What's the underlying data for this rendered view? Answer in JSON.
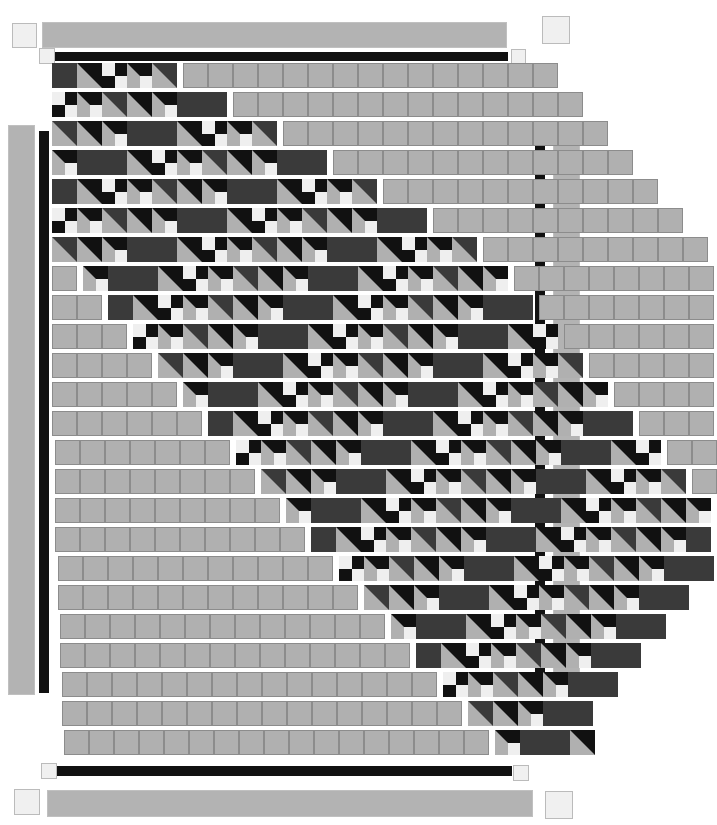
{
  "artwork": {
    "title": "Diagonal Staircase Quilt Pattern",
    "type": "abstract-geometric-pattern",
    "canvas": {
      "width": 590,
      "height": 825,
      "background": "#ffffff"
    }
  },
  "palette": {
    "light_gray": "#b0b0b0",
    "mid_gray": "#a8a8a8",
    "dark_gray": "#3a3a3a",
    "black": "#111111",
    "white": "#efefef",
    "border_light": "#c0c0c0",
    "corner": "#f0f0f0",
    "corner_stroke": "#bbbbbb",
    "cell_stroke": "#8c8c8c"
  },
  "geometry": {
    "cell_size": 25,
    "row_gap": 5,
    "rows": 24,
    "first_row_top": 63,
    "row_pitch": 29.2,
    "grid_left": 52,
    "grid_columns": 19
  },
  "borders": {
    "top_outer_bar": {
      "label": "top-light-bar",
      "x": 42,
      "y": 22,
      "w": 465,
      "h": 26,
      "color": "#b3b3b3"
    },
    "top_inner_bar": {
      "label": "top-black-bar",
      "x": 53,
      "y": 52,
      "w": 455,
      "h": 9,
      "color": "#111111"
    },
    "bottom_inner_bar": {
      "label": "bottom-black-bar",
      "x": 55,
      "y": 766,
      "w": 457,
      "h": 10,
      "color": "#111111"
    },
    "bottom_outer_bar": {
      "label": "bottom-light-bar",
      "x": 47,
      "y": 790,
      "w": 486,
      "h": 27,
      "color": "#b3b3b3"
    },
    "left_outer_bar": {
      "label": "left-light-bar",
      "x": 8,
      "y": 125,
      "w": 27,
      "h": 570,
      "color": "#b3b3b3"
    },
    "left_inner_bar": {
      "label": "left-black-bar",
      "x": 39,
      "y": 131,
      "w": 10,
      "h": 562,
      "color": "#111111"
    },
    "right_inner_bar": {
      "label": "right-black-bar",
      "x": 535,
      "y": 127,
      "w": 10,
      "h": 563,
      "color": "#111111"
    },
    "right_outer_bar": {
      "label": "right-light-bar",
      "x": 553,
      "y": 123,
      "w": 27,
      "h": 570,
      "color": "#b3b3b3"
    }
  },
  "corners": [
    {
      "name": "corner-top-left-outer",
      "x": 12,
      "y": 23,
      "size": 25
    },
    {
      "name": "corner-top-right-outer",
      "x": 542,
      "y": 16,
      "size": 28
    },
    {
      "name": "corner-top-left-inner",
      "x": 39,
      "y": 48,
      "size": 16
    },
    {
      "name": "corner-top-right-inner",
      "x": 511,
      "y": 49,
      "size": 15
    },
    {
      "name": "corner-bottom-left-inner",
      "x": 41,
      "y": 763,
      "size": 16
    },
    {
      "name": "corner-bottom-right-inner",
      "x": 513,
      "y": 765,
      "size": 16
    },
    {
      "name": "corner-bottom-left-outer",
      "x": 14,
      "y": 789,
      "size": 26
    },
    {
      "name": "corner-bottom-right-outer",
      "x": 545,
      "y": 791,
      "size": 28
    }
  ],
  "rows": [
    {
      "index": 0,
      "x": 52,
      "y": 63,
      "lead_plain": 0,
      "motif_cells": 5,
      "trail_plain": 15,
      "row_width": 500
    },
    {
      "index": 1,
      "x": 52,
      "y": 92,
      "lead_plain": 0,
      "motif_cells": 7,
      "trail_plain": 14,
      "row_width": 525
    },
    {
      "index": 2,
      "x": 52,
      "y": 121,
      "lead_plain": 0,
      "motif_cells": 9,
      "trail_plain": 13,
      "row_width": 550
    },
    {
      "index": 3,
      "x": 52,
      "y": 150,
      "lead_plain": 0,
      "motif_cells": 11,
      "trail_plain": 12,
      "row_width": 575
    },
    {
      "index": 4,
      "x": 52,
      "y": 179,
      "lead_plain": 0,
      "motif_cells": 13,
      "trail_plain": 11,
      "row_width": 600
    },
    {
      "index": 5,
      "x": 52,
      "y": 208,
      "lead_plain": 0,
      "motif_cells": 15,
      "trail_plain": 10,
      "row_width": 625
    },
    {
      "index": 6,
      "x": 52,
      "y": 237,
      "lead_plain": 0,
      "motif_cells": 17,
      "trail_plain": 9,
      "row_width": 650
    },
    {
      "index": 7,
      "x": 52,
      "y": 266,
      "lead_plain": 1,
      "motif_cells": 17,
      "trail_plain": 8,
      "row_width": 650
    },
    {
      "index": 8,
      "x": 52,
      "y": 295,
      "lead_plain": 2,
      "motif_cells": 17,
      "trail_plain": 7,
      "row_width": 650
    },
    {
      "index": 9,
      "x": 52,
      "y": 324,
      "lead_plain": 3,
      "motif_cells": 17,
      "trail_plain": 6,
      "row_width": 650
    },
    {
      "index": 10,
      "x": 52,
      "y": 353,
      "lead_plain": 4,
      "motif_cells": 17,
      "trail_plain": 5,
      "row_width": 650
    },
    {
      "index": 11,
      "x": 52,
      "y": 382,
      "lead_plain": 5,
      "motif_cells": 17,
      "trail_plain": 4,
      "row_width": 650
    },
    {
      "index": 12,
      "x": 52,
      "y": 411,
      "lead_plain": 6,
      "motif_cells": 17,
      "trail_plain": 3,
      "row_width": 650
    },
    {
      "index": 13,
      "x": 55,
      "y": 440,
      "lead_plain": 7,
      "motif_cells": 17,
      "trail_plain": 2,
      "row_width": 650
    },
    {
      "index": 14,
      "x": 55,
      "y": 469,
      "lead_plain": 8,
      "motif_cells": 17,
      "trail_plain": 1,
      "row_width": 650
    },
    {
      "index": 15,
      "x": 55,
      "y": 498,
      "lead_plain": 9,
      "motif_cells": 17,
      "trail_plain": 0,
      "row_width": 650
    },
    {
      "index": 16,
      "x": 55,
      "y": 527,
      "lead_plain": 10,
      "motif_cells": 16,
      "trail_plain": 0,
      "row_width": 650
    },
    {
      "index": 17,
      "x": 58,
      "y": 556,
      "lead_plain": 11,
      "motif_cells": 15,
      "trail_plain": 0,
      "row_width": 650
    },
    {
      "index": 18,
      "x": 58,
      "y": 585,
      "lead_plain": 12,
      "motif_cells": 13,
      "trail_plain": 0,
      "row_width": 625
    },
    {
      "index": 19,
      "x": 60,
      "y": 614,
      "lead_plain": 13,
      "motif_cells": 11,
      "trail_plain": 0,
      "row_width": 600
    },
    {
      "index": 20,
      "x": 60,
      "y": 643,
      "lead_plain": 14,
      "motif_cells": 9,
      "trail_plain": 0,
      "row_width": 575
    },
    {
      "index": 21,
      "x": 62,
      "y": 672,
      "lead_plain": 15,
      "motif_cells": 7,
      "trail_plain": 0,
      "row_width": 550
    },
    {
      "index": 22,
      "x": 62,
      "y": 701,
      "lead_plain": 16,
      "motif_cells": 5,
      "trail_plain": 0,
      "row_width": 525
    },
    {
      "index": 23,
      "x": 64,
      "y": 730,
      "lead_plain": 17,
      "motif_cells": 4,
      "trail_plain": 0,
      "row_width": 500
    }
  ],
  "motif": {
    "name": "diagonal-staircase-unit",
    "description": "Repeating 2-cell unit: dark square + half-square-triangle with checker step",
    "unit_cells": 2,
    "cell_types": [
      "solid-dark",
      "triangle-upper-right-black",
      "four-patch-checker",
      "solid-light"
    ]
  },
  "labels": {
    "canvas_title": ""
  }
}
